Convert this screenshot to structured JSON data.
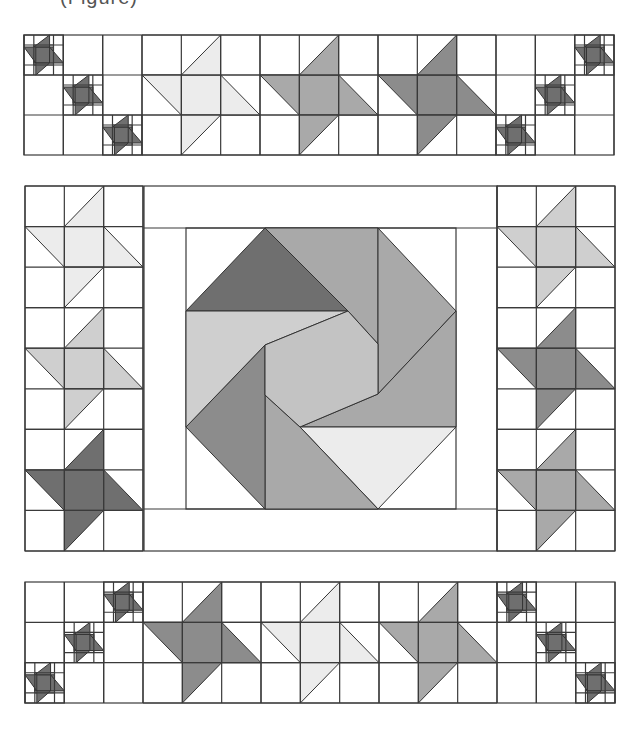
{
  "caption": "(Figure)",
  "colors": {
    "background": "#ffffff",
    "line": "#3a3a3a",
    "dark": "#6f6f6f",
    "darkmed": "#8c8c8c",
    "medium": "#a9a9a9",
    "light": "#cfcfcf",
    "lightest": "#ececec",
    "center": "#c3c3c3"
  },
  "top_strip": {
    "x": 24,
    "y": 35,
    "width": 590,
    "height": 120,
    "cols": 15,
    "rows": 3,
    "big_stars": [
      {
        "col": 3,
        "shade": "lightest"
      },
      {
        "col": 6,
        "shade": "medium"
      },
      {
        "col": 9,
        "shade": "darkmed"
      }
    ],
    "mini_stars": [
      {
        "col": 0,
        "row": 0
      },
      {
        "col": 1,
        "row": 1
      },
      {
        "col": 2,
        "row": 2
      },
      {
        "col": 14,
        "row": 0
      },
      {
        "col": 13,
        "row": 1
      },
      {
        "col": 12,
        "row": 2
      }
    ],
    "grid_cols": [
      3,
      4,
      5,
      6,
      7,
      8,
      9,
      10,
      11,
      12
    ]
  },
  "middle": {
    "x": 25,
    "y": 186,
    "width": 590,
    "height": 365,
    "left_column": {
      "x": 25,
      "width": 118,
      "rows": 9,
      "stars": [
        {
          "row": 0,
          "shade": "lightest"
        },
        {
          "row": 3,
          "shade": "light"
        },
        {
          "row": 6,
          "shade": "dark"
        }
      ]
    },
    "right_column": {
      "x": 497,
      "width": 118,
      "rows": 9,
      "stars": [
        {
          "row": 0,
          "shade": "light"
        },
        {
          "row": 3,
          "shade": "darkmed"
        },
        {
          "row": 6,
          "shade": "medium"
        }
      ]
    },
    "center_block": {
      "outer": {
        "x": 144,
        "y": 186,
        "width": 353,
        "height": 365
      },
      "inner": {
        "x": 186,
        "y": 228,
        "width": 270,
        "height": 281
      },
      "octagon_pinwheel": [
        {
          "name": "top-dark-triangle",
          "shade": "dark",
          "points": [
            [
              186,
              311
            ],
            [
              265,
              228
            ],
            [
              348,
              311
            ]
          ]
        },
        {
          "name": "top-right-parallelogram",
          "shade": "medium",
          "points": [
            [
              265,
              228
            ],
            [
              378,
              228
            ],
            [
              378,
              344
            ],
            [
              348,
              311
            ]
          ]
        },
        {
          "name": "right-upper-triangle",
          "shade": "medium",
          "points": [
            [
              378,
              228
            ],
            [
              456,
              311
            ],
            [
              378,
              394
            ]
          ]
        },
        {
          "name": "right-lower-parallelogram",
          "shade": "medium",
          "points": [
            [
              456,
              311
            ],
            [
              456,
              427
            ],
            [
              300,
              427
            ],
            [
              378,
              394
            ]
          ]
        },
        {
          "name": "bottom-light-triangle",
          "shade": "lightest",
          "points": [
            [
              456,
              427
            ],
            [
              378,
              509
            ],
            [
              300,
              427
            ]
          ]
        },
        {
          "name": "bottom-left-parallelogram",
          "shade": "medium",
          "points": [
            [
              378,
              509
            ],
            [
              265,
              509
            ],
            [
              265,
              395
            ],
            [
              300,
              427
            ]
          ]
        },
        {
          "name": "left-lower-triangle",
          "shade": "darkmed",
          "points": [
            [
              265,
              509
            ],
            [
              186,
              427
            ],
            [
              265,
              345
            ]
          ]
        },
        {
          "name": "left-upper-parallelogram",
          "shade": "light",
          "points": [
            [
              186,
              427
            ],
            [
              186,
              311
            ],
            [
              348,
              311
            ],
            [
              265,
              345
            ]
          ]
        },
        {
          "name": "center-square",
          "shade": "center",
          "points": [
            [
              265,
              345
            ],
            [
              348,
              311
            ],
            [
              378,
              344
            ],
            [
              378,
              394
            ],
            [
              300,
              427
            ],
            [
              265,
              395
            ]
          ]
        }
      ]
    }
  },
  "bottom_strip": {
    "x": 25,
    "y": 582,
    "width": 590,
    "height": 121,
    "cols": 15,
    "rows": 3,
    "big_stars": [
      {
        "col": 3,
        "shade": "darkmed"
      },
      {
        "col": 6,
        "shade": "lightest"
      },
      {
        "col": 9,
        "shade": "medium"
      }
    ],
    "mini_stars": [
      {
        "col": 0,
        "row": 2
      },
      {
        "col": 1,
        "row": 1
      },
      {
        "col": 2,
        "row": 0
      },
      {
        "col": 12,
        "row": 0
      },
      {
        "col": 13,
        "row": 1
      },
      {
        "col": 14,
        "row": 2
      }
    ],
    "grid_cols": [
      3,
      4,
      5,
      6,
      7,
      8,
      9,
      10,
      11,
      12
    ]
  }
}
